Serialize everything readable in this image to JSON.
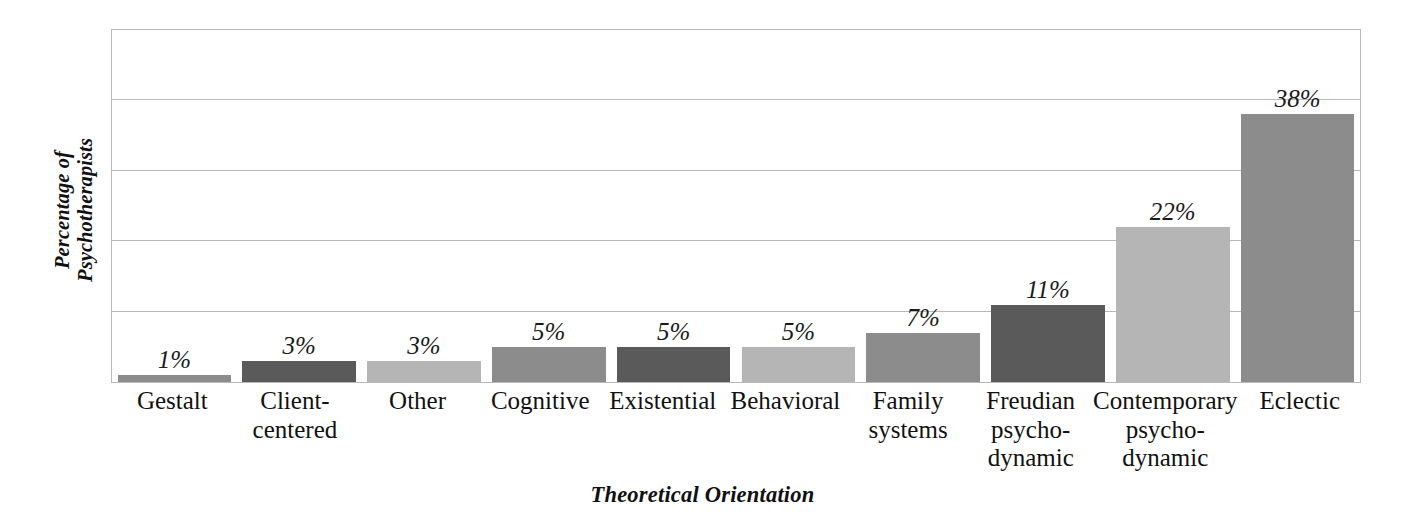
{
  "chart_data": {
    "type": "bar",
    "title": "",
    "xlabel": "Theoretical Orientation",
    "ylabel": "Percentage of Psychotherapists",
    "ylabel_lines": [
      "Percentage of",
      "Psychotherapists"
    ],
    "categories": [
      "Gestalt",
      "Client-centered",
      "Other",
      "Cognitive",
      "Existential",
      "Behavioral",
      "Family systems",
      "Freudian psycho-dynamic",
      "Contemporary psycho-dynamic",
      "Eclectic"
    ],
    "category_lines": [
      [
        "Gestalt"
      ],
      [
        "Client-",
        "centered"
      ],
      [
        "Other"
      ],
      [
        "Cognitive"
      ],
      [
        "Existential"
      ],
      [
        "Behavioral"
      ],
      [
        "Family",
        "systems"
      ],
      [
        "Freudian",
        "psycho-",
        "dynamic"
      ],
      [
        "Contemporary",
        "psycho-",
        "dynamic"
      ],
      [
        "Eclectic"
      ]
    ],
    "values": [
      1,
      3,
      3,
      5,
      5,
      5,
      7,
      11,
      22,
      38
    ],
    "value_labels": [
      "1%",
      "3%",
      "3%",
      "5%",
      "5%",
      "5%",
      "7%",
      "11%",
      "22%",
      "38%"
    ],
    "bar_colors": [
      "#8c8c8c",
      "#5a5a5a",
      "#b5b5b5",
      "#8c8c8c",
      "#5a5a5a",
      "#b5b5b5",
      "#8c8c8c",
      "#5a5a5a",
      "#b5b5b5",
      "#8c8c8c"
    ],
    "ylim": [
      0,
      50
    ],
    "gridlines": [
      10,
      20,
      30,
      40,
      50
    ],
    "grid": true,
    "legend": "none",
    "plot_border_color": "#b9b9b9",
    "gridline_color": "#b9b9b9",
    "background": "#ffffff",
    "text_color": "#111111"
  }
}
